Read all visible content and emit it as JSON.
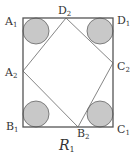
{
  "diagram": {
    "title": "R1",
    "title_main": "R",
    "title_sub": "1",
    "colors": {
      "stroke": "#555555",
      "circle_fill": "#c8c8c8",
      "circle_stroke": "#666666",
      "background": "#ffffff"
    },
    "outer_square": {
      "vertices": [
        "A1",
        "D1",
        "C1",
        "B1"
      ]
    },
    "inner_quadrilateral": {
      "vertices": [
        "D2",
        "C2",
        "B2",
        "A2"
      ]
    },
    "labels": [
      {
        "id": "A1",
        "main": "A",
        "sub": "1"
      },
      {
        "id": "D2",
        "main": "D",
        "sub": "2"
      },
      {
        "id": "D1",
        "main": "D",
        "sub": "1"
      },
      {
        "id": "C2",
        "main": "C",
        "sub": "2"
      },
      {
        "id": "A2",
        "main": "A",
        "sub": "2"
      },
      {
        "id": "B1",
        "main": "B",
        "sub": "1"
      },
      {
        "id": "B2",
        "main": "B",
        "sub": "2"
      },
      {
        "id": "C1",
        "main": "C",
        "sub": "1"
      }
    ],
    "circles": [
      {
        "corner": "A1",
        "shaded": true
      },
      {
        "corner": "D1",
        "shaded": true
      },
      {
        "corner": "B1",
        "shaded": true
      },
      {
        "corner": "C1",
        "shaded": true
      }
    ]
  }
}
